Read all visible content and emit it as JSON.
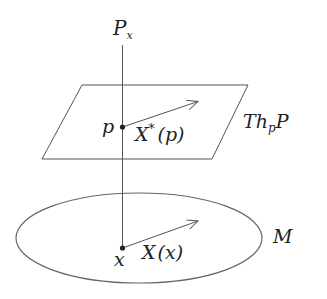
{
  "diagram": {
    "type": "fiber-bundle-horizontal-lift",
    "colors": {
      "stroke": "#555555",
      "text": "#222222",
      "background": "#ffffff"
    },
    "labels": {
      "fiber": {
        "main": "P",
        "sub": "x"
      },
      "tangent_plane": {
        "t": "T",
        "h": "h",
        "sub": "p",
        "p": "P"
      },
      "point_p": "p",
      "lifted_vector": {
        "main": "X",
        "sup": "*",
        "arg": "(p)"
      },
      "manifold": "M",
      "point_x": "x",
      "base_vector": {
        "main": "X",
        "arg": "(x)"
      }
    },
    "elements": {
      "fiber_line": {
        "x": 122.5,
        "y1": 45,
        "y2": 248
      },
      "tangent_plane": {
        "points": [
          [
            82,
            85
          ],
          [
            248,
            85
          ],
          [
            212,
            159
          ],
          [
            42,
            159
          ]
        ]
      },
      "point_p": {
        "cx": 122.5,
        "cy": 127
      },
      "lift_arrow": {
        "x1": 122.5,
        "y1": 127,
        "x2": 198,
        "y2": 101
      },
      "manifold_ellipse": {
        "cx": 139,
        "cy": 238,
        "rx": 123,
        "ry": 45
      },
      "point_x": {
        "cx": 122.5,
        "cy": 248
      },
      "base_arrow": {
        "x1": 122.5,
        "y1": 248,
        "x2": 198,
        "y2": 221
      }
    }
  }
}
